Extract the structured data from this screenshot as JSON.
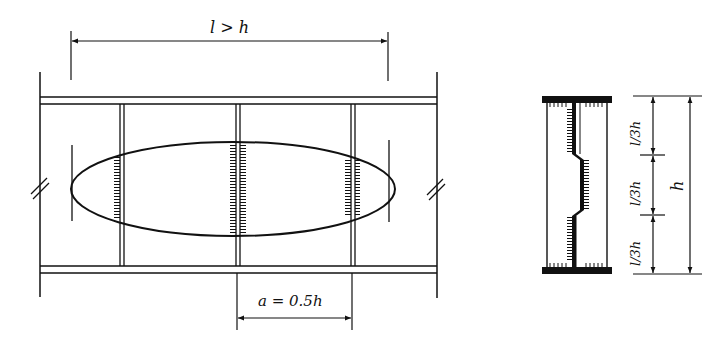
{
  "diagram": {
    "elevation": {
      "span_label": "l > h",
      "stiffener_spacing_label": "a = 0.5h",
      "break_marks": [
        "break-left",
        "break-right"
      ],
      "stiffener_count": 3,
      "region_shape": "ellipse"
    },
    "section": {
      "segment_labels": [
        "l/3h",
        "l/3h",
        "l/3h"
      ],
      "height_label": "h"
    },
    "colors": {
      "ink": "#111111",
      "background": "#ffffff"
    }
  }
}
